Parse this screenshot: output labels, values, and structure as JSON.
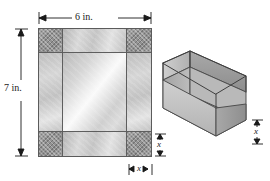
{
  "figure": {
    "colors": {
      "outline": "#5b5b5b",
      "grid_line": "#5e5e5e",
      "cut_corner": "#9a9a9a",
      "flap": "#c8c8c8",
      "base": "#e4e4e4",
      "box_outer_wall": "#9d9d9d",
      "box_inner_wall": "#b5b5b5",
      "box_floor": "#d2d2d2",
      "box_rim": "#bcbcbc",
      "text": "#1a1a1a"
    }
  },
  "flat_sheet": {
    "name": "flat-metal-sheet",
    "width_label": "6 in.",
    "height_label": "7 in.",
    "corner_side_label": "x",
    "corner_height_label": "x",
    "grid": {
      "columns": 3,
      "rows": 3,
      "cells": [
        {
          "id": "top-left",
          "kind": "cut-corner"
        },
        {
          "id": "top-middle",
          "kind": "flap"
        },
        {
          "id": "top-right",
          "kind": "cut-corner"
        },
        {
          "id": "middle-left",
          "kind": "flap"
        },
        {
          "id": "center",
          "kind": "base"
        },
        {
          "id": "middle-right",
          "kind": "flap"
        },
        {
          "id": "bottom-left",
          "kind": "cut-corner"
        },
        {
          "id": "bottom-middle",
          "kind": "flap"
        },
        {
          "id": "bottom-right",
          "kind": "cut-corner"
        }
      ]
    }
  },
  "open_box": {
    "name": "open-rectangular-box",
    "height_label": "x",
    "open_top": true
  },
  "dimensions": [
    {
      "id": "sheet-width",
      "label": "6 in.",
      "orientation": "horizontal",
      "target": "flat-sheet-top"
    },
    {
      "id": "sheet-height",
      "label": "7 in.",
      "orientation": "vertical",
      "target": "flat-sheet-left"
    },
    {
      "id": "corner-height",
      "label": "x",
      "orientation": "vertical",
      "target": "flat-sheet-corner-right"
    },
    {
      "id": "corner-width",
      "label": "x",
      "orientation": "horizontal",
      "target": "flat-sheet-corner-bottom"
    },
    {
      "id": "box-height",
      "label": "x",
      "orientation": "vertical",
      "target": "open-box-right"
    }
  ]
}
